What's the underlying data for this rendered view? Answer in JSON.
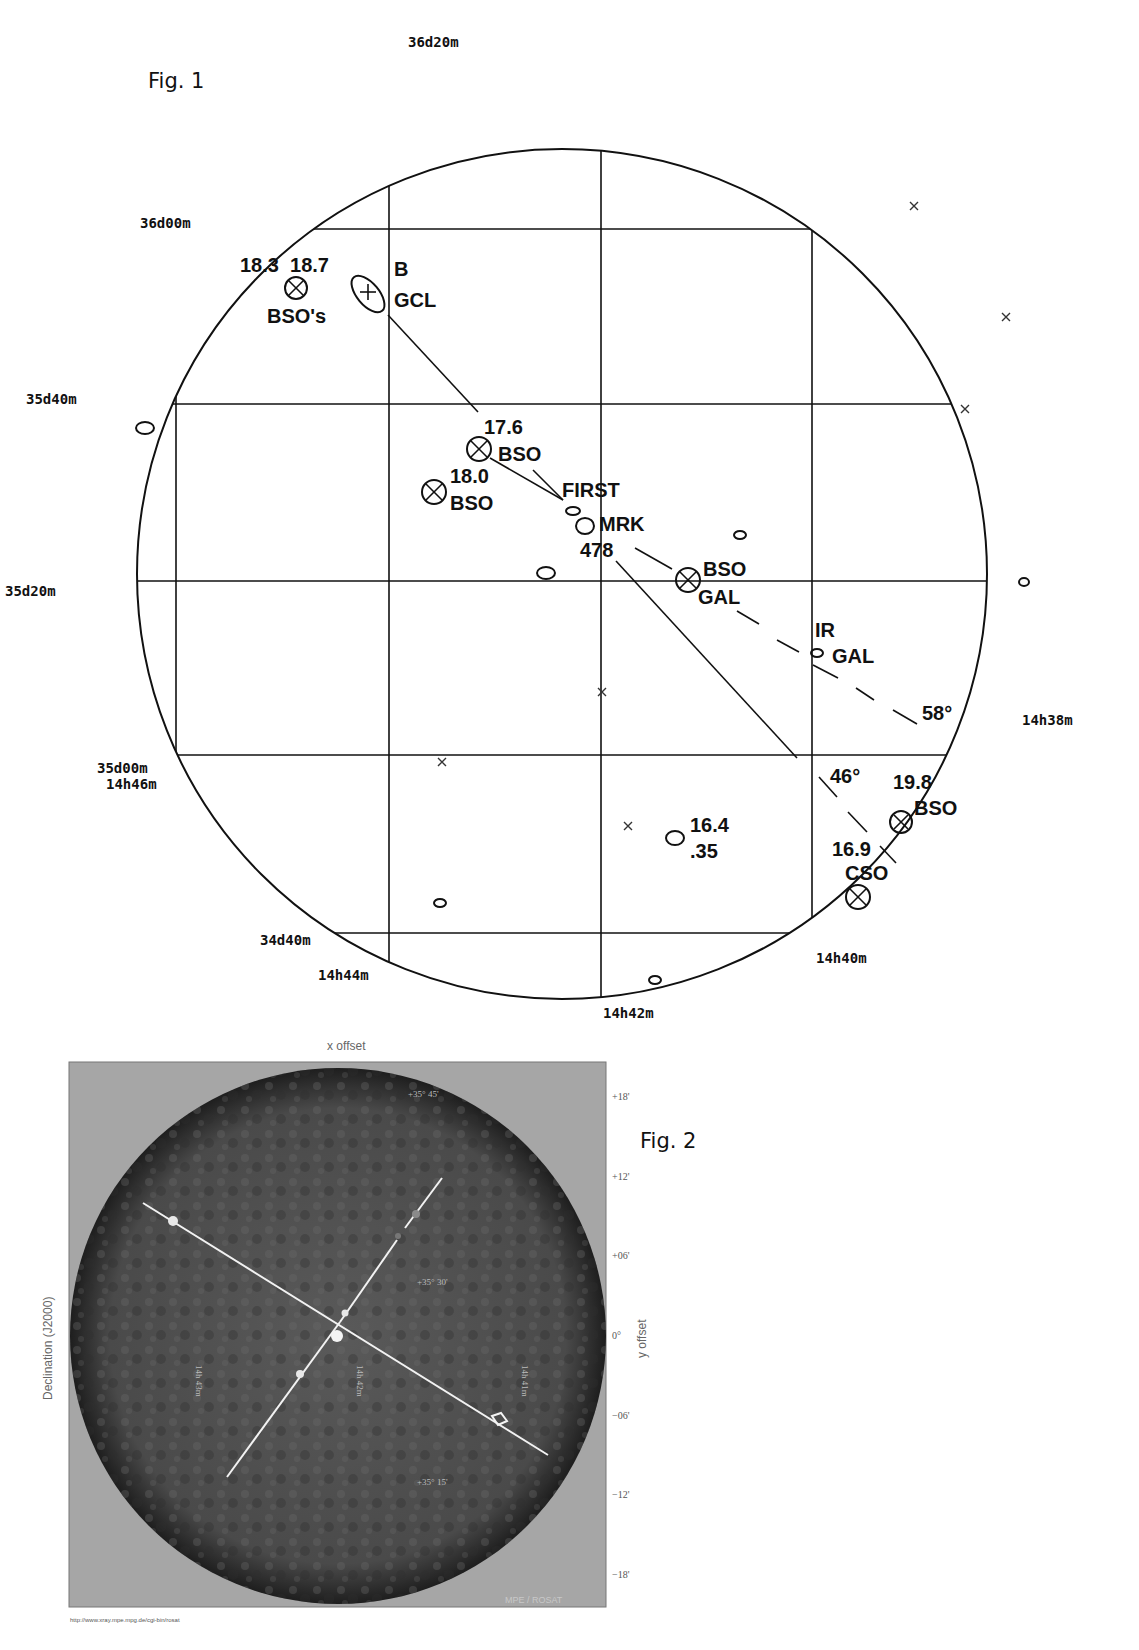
{
  "fig1": {
    "title": "Fig. 1",
    "dec_labels": [
      "36d20m",
      "36d00m",
      "35d40m",
      "35d20m",
      "35d00m",
      "34d40m"
    ],
    "ra_labels": [
      "14h46m",
      "14h44m",
      "14h42m",
      "14h40m",
      "14h38m"
    ],
    "annotations": {
      "bso_pair_mags": "18.3  18.7",
      "bso_pair_label": "BSO's",
      "gcl_b": "B",
      "gcl": "GCL",
      "bso1_mag": "17.6",
      "bso1_label": "BSO",
      "bso2_mag": "18.0",
      "bso2_label": "BSO",
      "first": "FIRST",
      "mrk": "MRK",
      "mrk_num": "478",
      "bso_gal_1": "BSO",
      "bso_gal_2": "GAL",
      "ir": "IR",
      "ir_gal": "GAL",
      "angle_58": "58°",
      "angle_46": "46°",
      "bso3_mag": "19.8",
      "bso3_label": "BSO",
      "cso_mag": "16.9",
      "cso_label": "CSO",
      "gal_mag": "16.4",
      "gal_z": ".35"
    }
  },
  "fig2": {
    "title": "Fig. 2",
    "x_axis_label": "x offset",
    "y_axis_label": "y offset",
    "left_axis_label": "Declination (J2000)",
    "x_ticks": [
      "+18'",
      "+12'",
      "+06'",
      "0°",
      "−06'",
      "−12'",
      "−18'"
    ],
    "y_ticks": [
      "+18'",
      "+12'",
      "+06'",
      "0°",
      "−06'",
      "−12'",
      "−18'"
    ],
    "overlay_dec": [
      "+35° 45'",
      "+35° 30'",
      "+35° 15'"
    ],
    "overlay_ra": [
      "14h 43m",
      "14h 42m",
      "14h 41m"
    ],
    "footer_url": "http://www.xray.mpe.mpg.de/cgi-bin/rosat",
    "watermark": "MPE / ROSAT"
  }
}
